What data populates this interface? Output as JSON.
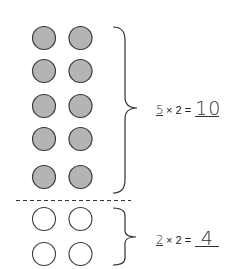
{
  "colors": {
    "filled_circle": "#b4b4b4",
    "circle_stroke": "#3a3a3a",
    "empty_circle": "#ffffff",
    "line": "#333333"
  },
  "groups": [
    {
      "name": "filled-group",
      "rows": 5,
      "columns": 2,
      "filled": true,
      "equation": {
        "factor_answer": "5",
        "operator": "×",
        "factor": "2",
        "equals": "=",
        "product_answer": "10"
      }
    },
    {
      "name": "empty-group",
      "rows": 2,
      "columns": 2,
      "filled": false,
      "equation": {
        "factor_answer": "2",
        "operator": "×",
        "factor": "2",
        "equals": "=",
        "product_answer": "4"
      }
    }
  ]
}
